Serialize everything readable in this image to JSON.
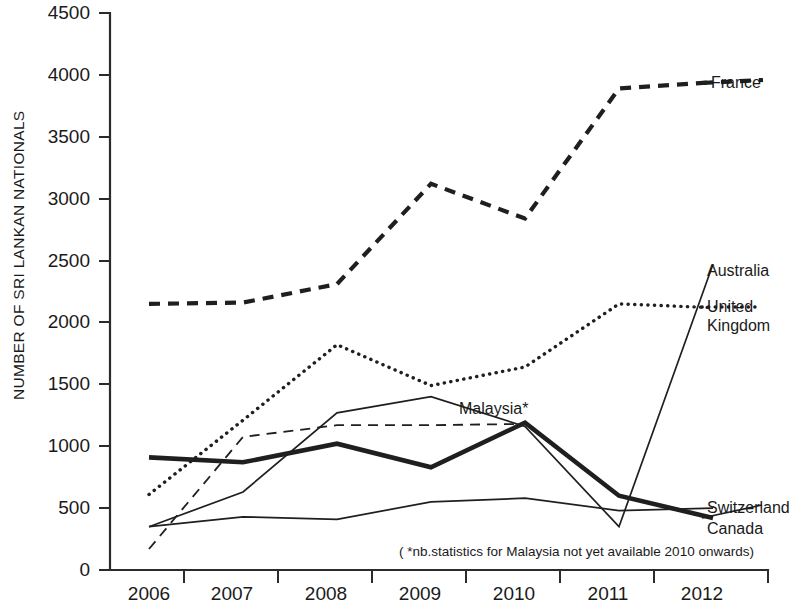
{
  "chart_data": {
    "type": "line",
    "title": "",
    "xlabel": "",
    "ylabel": "NUMBER OF SRI LANKAN NATIONALS",
    "categories": [
      "2006",
      "2007",
      "2008",
      "2009",
      "2010",
      "2011",
      "2012"
    ],
    "ylim": [
      0,
      4500
    ],
    "yticks": [
      0,
      500,
      1000,
      1500,
      2000,
      2500,
      3000,
      3500,
      4000,
      4500
    ],
    "grid": false,
    "legend_position": "right-inline-labels",
    "annotations": [
      "( *nb.statistics for Malaysia not yet available 2010 onwards)"
    ],
    "series": [
      {
        "name": "France",
        "style": "dashed-heavy",
        "values": [
          2150,
          2160,
          2310,
          3120,
          2840,
          3890,
          3940
        ]
      },
      {
        "name": "United Kingdom",
        "style": "dotted",
        "values": [
          610,
          1210,
          1820,
          1490,
          1640,
          2150,
          2120
        ]
      },
      {
        "name": "Australia",
        "style": "thin",
        "values": [
          350,
          630,
          1270,
          1400,
          1160,
          350,
          2470
        ]
      },
      {
        "name": "Malaysia*",
        "style": "dashed-light",
        "values": [
          170,
          1075,
          1170,
          1170,
          1180,
          null,
          null
        ]
      },
      {
        "name": "Canada",
        "style": "thick",
        "values": [
          910,
          870,
          1020,
          830,
          1190,
          600,
          420
        ]
      },
      {
        "name": "Switzerland",
        "style": "thin",
        "values": [
          350,
          430,
          410,
          550,
          580,
          480,
          500
        ]
      }
    ]
  },
  "axis": {
    "y_title": "NUMBER OF SRI LANKAN NATIONALS",
    "y_tick_labels": [
      "4500",
      "4000",
      "3500",
      "3000",
      "2500",
      "2000",
      "1500",
      "1000",
      "500",
      "0"
    ],
    "x_tick_labels": [
      "2006",
      "2007",
      "2008",
      "2009",
      "2010",
      "2011",
      "2012"
    ]
  },
  "labels": {
    "france": "France",
    "australia": "Australia",
    "united_kingdom_line1": "United",
    "united_kingdom_line2": "Kingdom",
    "malaysia": "Malaysia*",
    "switzerland": "Switzerland",
    "canada": "Canada",
    "footnote": "( *nb.statistics for Malaysia not yet available 2010 onwards)"
  },
  "colors": {
    "ink": "#1f1f1f",
    "background": "#ffffff"
  }
}
